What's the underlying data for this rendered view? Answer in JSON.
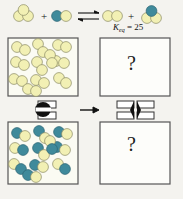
{
  "figure": {
    "type": "chemistry-equilibrium-diagram",
    "background_color": "#f4f3ef",
    "equation": {
      "reactants": [
        {
          "name": "yellow-trimer",
          "colors": [
            "#f2f0b4",
            "#f2f0b4",
            "#f2f0b4"
          ]
        },
        {
          "name": "teal-yellow-dimer",
          "colors": [
            "#3f8a9b",
            "#f2f0b4"
          ]
        }
      ],
      "arrow": {
        "name": "equilibrium-arrow",
        "glyph": "⇌"
      },
      "plus_sign": "+",
      "products": [
        {
          "name": "yellow-dimer",
          "colors": [
            "#f2f0b4",
            "#f2f0b4"
          ]
        },
        {
          "name": "teal-yellow-trimer",
          "colors": [
            "#3f8a9b",
            "#f2f0b4",
            "#f2f0b4"
          ]
        }
      ]
    },
    "keq": {
      "symbol": "K",
      "subscript": "eq",
      "equals": "=",
      "value": "25"
    },
    "boxes": [
      {
        "name": "top-left-vessel",
        "content_type": "molecules",
        "molecule_label": "yellow-dimer",
        "count": 17,
        "question_mark": null
      },
      {
        "name": "top-right-vessel",
        "content_type": "unknown",
        "molecule_label": null,
        "count": 0,
        "question_mark": "?"
      },
      {
        "name": "bottom-left-vessel",
        "content_type": "molecules",
        "molecule_label": "teal-yellow-dimer",
        "count": 17,
        "question_mark": null
      },
      {
        "name": "bottom-right-vessel",
        "content_type": "unknown",
        "molecule_label": null,
        "count": 0,
        "question_mark": "?"
      }
    ],
    "valves": [
      {
        "name": "left-valve",
        "state": "closed"
      },
      {
        "name": "right-valve",
        "state": "open"
      }
    ],
    "process_arrow": {
      "name": "process-arrow",
      "direction": "right"
    },
    "colors": {
      "molecule_yellow": "#f2f0b4",
      "molecule_teal": "#3f8a9b",
      "outline": "#7a7a62",
      "box_border": "#4a4a4a",
      "background": "#f4f3ef",
      "valve_fill": "#111111"
    }
  }
}
